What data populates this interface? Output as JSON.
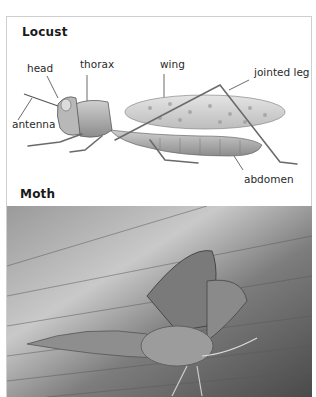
{
  "locust": {
    "title": "Locust",
    "labels": {
      "head": "head",
      "thorax": "thorax",
      "wing": "wing",
      "jointed_leg": "jointed leg",
      "antenna": "antenna",
      "abdomen": "abdomen"
    }
  },
  "moth": {
    "title": "Moth"
  }
}
